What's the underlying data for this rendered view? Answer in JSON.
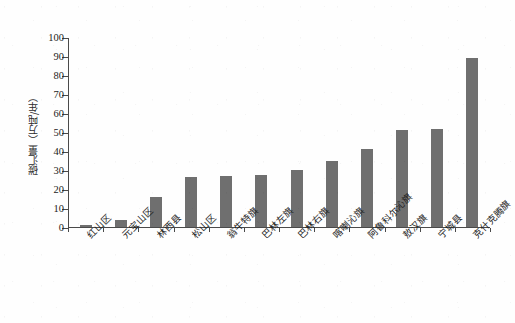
{
  "chart_data": {
    "type": "bar",
    "title": "",
    "subtitle": "",
    "xlabel": "",
    "ylabel": "碳汇量（万吨/年）",
    "ylim": [
      0,
      100
    ],
    "yticks": [
      0,
      10,
      20,
      30,
      40,
      50,
      60,
      70,
      80,
      90,
      100
    ],
    "ytick_labels": [
      "0",
      "10",
      "20",
      "30",
      "40",
      "50",
      "60",
      "70",
      "80",
      "90",
      "100"
    ],
    "grid": false,
    "legend": null,
    "bar_color": "#6f6f6f",
    "axis_color": "#4a4a4a",
    "categories": [
      "红山区",
      "元宝山区",
      "林西县",
      "松山区",
      "翁牛特旗",
      "巴林左旗",
      "巴林右旗",
      "喀喇沁旗",
      "阿鲁科尔沁旗",
      "敖汉旗",
      "宁城县",
      "克什克腾旗"
    ],
    "values": [
      1,
      3.5,
      16,
      26.5,
      27,
      27.5,
      30,
      35,
      41,
      51,
      51.5,
      89
    ]
  }
}
